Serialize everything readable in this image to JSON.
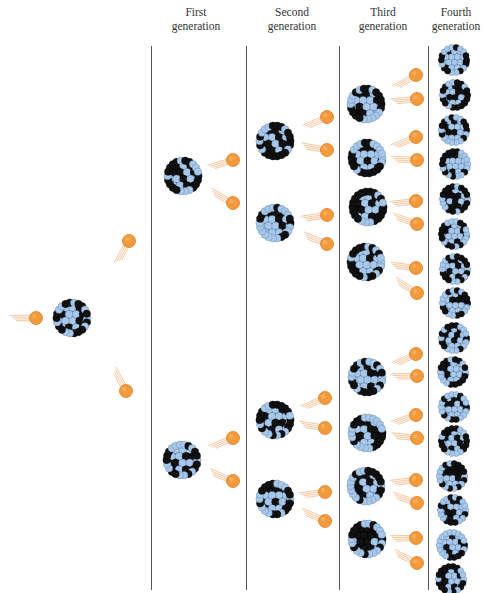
{
  "headers": [
    {
      "line1": "First",
      "line2": "generation",
      "x": 196
    },
    {
      "line1": "Second",
      "line2": "generation",
      "x": 292
    },
    {
      "line1": "Third",
      "line2": "generation",
      "x": 383
    },
    {
      "line1": "Fourth",
      "line2": "generation",
      "x": 456
    }
  ],
  "dividers": [
    {
      "x": 151,
      "top": 46,
      "bottom": 590
    },
    {
      "x": 246,
      "top": 46,
      "bottom": 590
    },
    {
      "x": 339,
      "top": 46,
      "bottom": 590
    },
    {
      "x": 428,
      "top": 46,
      "bottom": 590
    }
  ],
  "colors": {
    "neutron": "#f39a3c",
    "neutron_edge": "#e07a1f",
    "trail": "#f0a060",
    "nucleus_dark": "#111111",
    "nucleus_light": "#a8c8ea",
    "line": "#555555",
    "text": "#333333"
  },
  "incoming_neutron": {
    "x": 36,
    "y": 318
  },
  "initial_nucleus": {
    "x": 72,
    "y": 318,
    "r": 17
  },
  "initial_neutrons": [
    {
      "x": 129,
      "y": 241
    },
    {
      "x": 126,
      "y": 391
    }
  ],
  "generations": [
    {
      "nuclei": [
        {
          "x": 183,
          "y": 176
        },
        {
          "x": 182,
          "y": 460
        }
      ],
      "neutrons": [
        {
          "x": 233,
          "y": 160
        },
        {
          "x": 233,
          "y": 203
        },
        {
          "x": 233,
          "y": 438
        },
        {
          "x": 233,
          "y": 481
        }
      ]
    },
    {
      "nuclei": [
        {
          "x": 275,
          "y": 141
        },
        {
          "x": 275,
          "y": 223
        },
        {
          "x": 275,
          "y": 420
        },
        {
          "x": 275,
          "y": 499
        }
      ],
      "neutrons": [
        {
          "x": 327,
          "y": 117
        },
        {
          "x": 327,
          "y": 150
        },
        {
          "x": 327,
          "y": 215
        },
        {
          "x": 327,
          "y": 244
        },
        {
          "x": 325,
          "y": 398
        },
        {
          "x": 325,
          "y": 428
        },
        {
          "x": 325,
          "y": 492
        },
        {
          "x": 325,
          "y": 521
        }
      ]
    },
    {
      "nuclei": [
        {
          "x": 366,
          "y": 104
        },
        {
          "x": 367,
          "y": 158
        },
        {
          "x": 368,
          "y": 207
        },
        {
          "x": 366,
          "y": 262
        },
        {
          "x": 367,
          "y": 377
        },
        {
          "x": 367,
          "y": 433
        },
        {
          "x": 366,
          "y": 486
        },
        {
          "x": 367,
          "y": 539
        }
      ],
      "neutrons": [
        {
          "x": 416,
          "y": 75
        },
        {
          "x": 417,
          "y": 99
        },
        {
          "x": 416,
          "y": 137
        },
        {
          "x": 417,
          "y": 160
        },
        {
          "x": 416,
          "y": 201
        },
        {
          "x": 417,
          "y": 224
        },
        {
          "x": 416,
          "y": 268
        },
        {
          "x": 417,
          "y": 293
        },
        {
          "x": 416,
          "y": 354
        },
        {
          "x": 417,
          "y": 376
        },
        {
          "x": 416,
          "y": 415
        },
        {
          "x": 417,
          "y": 438
        },
        {
          "x": 416,
          "y": 480
        },
        {
          "x": 417,
          "y": 503
        },
        {
          "x": 416,
          "y": 538
        },
        {
          "x": 417,
          "y": 563
        }
      ]
    },
    {
      "nuclei": [
        {
          "x": 454,
          "y": 60
        },
        {
          "x": 455,
          "y": 95
        },
        {
          "x": 454,
          "y": 130
        },
        {
          "x": 455,
          "y": 164
        },
        {
          "x": 455,
          "y": 199
        },
        {
          "x": 454,
          "y": 234
        },
        {
          "x": 455,
          "y": 269
        },
        {
          "x": 455,
          "y": 303
        },
        {
          "x": 454,
          "y": 338
        },
        {
          "x": 453,
          "y": 372
        },
        {
          "x": 454,
          "y": 407
        },
        {
          "x": 454,
          "y": 441
        },
        {
          "x": 452,
          "y": 476
        },
        {
          "x": 453,
          "y": 510
        },
        {
          "x": 452,
          "y": 545
        },
        {
          "x": 451,
          "y": 579
        }
      ],
      "neutrons": []
    }
  ]
}
